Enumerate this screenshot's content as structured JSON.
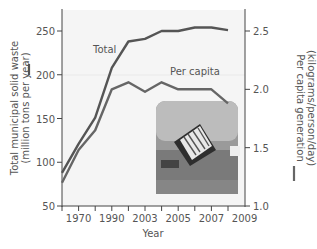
{
  "chart_data": {
    "type": "line",
    "title": "",
    "xlabel": "Year",
    "ylabel_left": "Total municipal solid waste (million tons per year)",
    "ylabel_right": "Per capita generation (kilograms/person/day)",
    "x_tick_labels": [
      "1970",
      "1990",
      "2003",
      "2005",
      "2007",
      "2009"
    ],
    "x_points": 11,
    "ylim_left": [
      50,
      270
    ],
    "yticks_left": [
      50,
      100,
      150,
      200,
      250
    ],
    "ylim_right": [
      1.0,
      2.65
    ],
    "yticks_right": [
      "1.0",
      "1.5",
      "2.0",
      "2.5"
    ],
    "series": [
      {
        "name": "Total",
        "axis": "left",
        "color": "#555555",
        "values": [
          88,
          121,
          151,
          208,
          238,
          241,
          250,
          250,
          254,
          254,
          251
        ]
      },
      {
        "name": "Per capita",
        "axis": "right",
        "color": "#666666",
        "values": [
          1.2,
          1.48,
          1.65,
          2.0,
          2.06,
          1.98,
          2.06,
          2.0,
          2.0,
          2.0,
          1.88
        ]
      }
    ],
    "annotations": [
      "Total",
      "Per capita"
    ],
    "grid": false,
    "inset_image": "garbage truck dumping waste at landfill"
  }
}
